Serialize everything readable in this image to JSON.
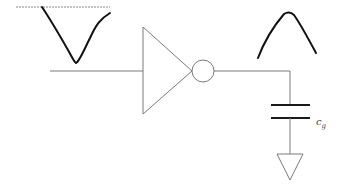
{
  "diagram": {
    "type": "CMOS inverter driving load capacitance",
    "components": [
      {
        "id": "input-wire",
        "kind": "wire"
      },
      {
        "id": "inverter",
        "kind": "inverter (triangle + bubble)"
      },
      {
        "id": "output-wire",
        "kind": "wire"
      },
      {
        "id": "load-capacitor",
        "kind": "capacitor"
      },
      {
        "id": "ground",
        "kind": "ground symbol"
      }
    ],
    "waveforms": {
      "input": "falling-then-rising pulse (V shape) under dashed reference line",
      "output": "rising-then-falling pulse (inverted shape)"
    },
    "capacitor_label": {
      "main": "c",
      "subscript": "g"
    }
  }
}
